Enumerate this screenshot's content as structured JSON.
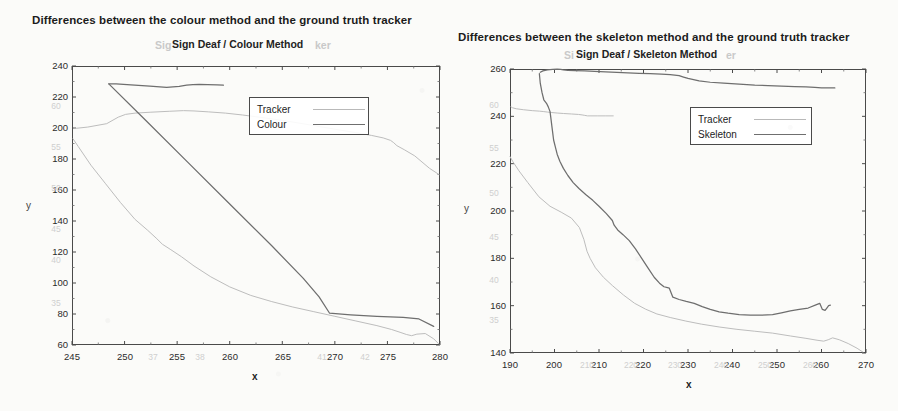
{
  "page": {
    "background": "#fbfbf9",
    "tracker_color": "#bdbdbd",
    "method_color": "#6e6e6e",
    "axis_color": "#4a4a4a"
  },
  "figures": [
    {
      "id": "colour",
      "caption": "Differences between the colour method and the ground truth tracker",
      "chart_title": "Sign Deaf / Colour Method",
      "ghost_title_left": "Sig",
      "ghost_title_right": "ker",
      "xlabel": "x",
      "ylabel": "y",
      "legend": [
        {
          "label": "Tracker",
          "style": "tracker"
        },
        {
          "label": "Colour",
          "style": "method"
        }
      ],
      "chart_data": {
        "type": "line",
        "title": "Sign Deaf / Colour Method",
        "xlabel": "x",
        "ylabel": "y",
        "xlim": [
          245,
          280
        ],
        "ylim": [
          60,
          240
        ],
        "xticks": [
          245,
          250,
          255,
          260,
          265,
          270,
          275,
          280
        ],
        "yticks": [
          60,
          80,
          100,
          120,
          140,
          160,
          180,
          200,
          220,
          240
        ],
        "ghost_xticks": [
          "37",
          "38",
          "41",
          "42"
        ],
        "ghost_yticks": [
          "60",
          "55",
          "50",
          "45",
          "40",
          "35"
        ],
        "grid": false,
        "legend_position": "upper-right",
        "series": [
          {
            "name": "Tracker",
            "x": [
              245.2,
              245.4,
              246.5,
              248.3,
              249.4,
              250.1,
              251.0,
              252.5,
              254.3,
              255.6,
              256.6,
              258.0,
              259.6,
              261.2,
              262.8,
              264.5,
              266.4,
              268.3,
              270.2,
              272.0,
              273.5,
              274.6,
              275.3,
              275.6,
              275.9,
              276.6,
              277.6,
              279.0,
              279.9
            ],
            "y": [
              200.0,
              199.8,
              200.6,
              202.8,
              207.0,
              208.8,
              209.6,
              210.2,
              210.8,
              211.2,
              211.0,
              210.4,
              209.6,
              208.4,
              207.0,
              205.4,
              203.4,
              201.2,
              199.0,
              197.0,
              195.2,
              193.6,
              192.0,
              190.5,
              188.6,
              186.0,
              182.0,
              174.0,
              170.0
            ]
          },
          {
            "name": "Tracker-lower",
            "x": [
              245.1,
              245.6,
              246.8,
              248.2,
              249.6,
              251.0,
              252.2,
              253.0,
              253.6,
              254.4,
              255.4,
              256.6,
              258.2,
              260.0,
              262.0,
              264.0,
              266.0,
              268.0,
              270.0,
              272.0,
              274.0,
              275.4,
              276.2,
              276.8,
              277.3,
              277.8,
              278.6,
              279.4,
              279.9
            ],
            "y": [
              193.0,
              188.0,
              176.0,
              164.0,
              152.0,
              141.0,
              134.0,
              129.0,
              125.0,
              121.5,
              117.0,
              111.0,
              104.0,
              97.5,
              92.0,
              88.0,
              84.5,
              81.5,
              78.5,
              75.5,
              72.5,
              70.0,
              68.2,
              66.8,
              66.0,
              67.0,
              67.4,
              64.0,
              60.6
            ]
          },
          {
            "name": "Colour",
            "x": [
              248.5,
              249.2,
              250.6,
              252.4,
              254.0,
              255.2,
              255.9,
              256.5,
              257.1,
              257.9,
              258.8,
              259.4
            ],
            "y": [
              228.5,
              228.4,
              227.8,
              227.0,
              226.2,
              226.8,
              227.6,
              228.0,
              228.1,
              228.0,
              227.8,
              227.6
            ]
          },
          {
            "name": "Colour-descent",
            "x": [
              248.5,
              252.0,
              256.0,
              260.0,
              264.0,
              267.0,
              268.5,
              269.5,
              271.5,
              274.0,
              276.5,
              278.0,
              279.4
            ],
            "y": [
              228.5,
              205.0,
              178.0,
              151.0,
              124.0,
              103.0,
              91.0,
              80.5,
              79.5,
              78.5,
              77.8,
              76.8,
              72.0
            ]
          }
        ]
      }
    },
    {
      "id": "skeleton",
      "caption": "Differences between the skeleton method and the ground truth tracker",
      "chart_title": "Sign Deaf / Skeleton Method",
      "ghost_title_left": "Si",
      "ghost_title_right": "er",
      "xlabel": "x",
      "ylabel": "y",
      "legend": [
        {
          "label": "Tracker",
          "style": "tracker"
        },
        {
          "label": "Skeleton",
          "style": "method"
        }
      ],
      "chart_data": {
        "type": "line",
        "title": "Sign Deaf / Skeleton Method",
        "xlabel": "x",
        "ylabel": "y",
        "xlim": [
          190,
          270
        ],
        "ylim": [
          140,
          260
        ],
        "xticks": [
          190,
          200,
          210,
          220,
          230,
          240,
          250,
          260,
          270
        ],
        "yticks": [
          140,
          160,
          180,
          200,
          220,
          240,
          260
        ],
        "ghost_xticks": [
          "210",
          "220",
          "230",
          "240",
          "250",
          "260"
        ],
        "ghost_yticks": [
          "60",
          "55",
          "50",
          "45",
          "40",
          "35"
        ],
        "grid": false,
        "legend_position": "upper-right",
        "series": [
          {
            "name": "Tracker",
            "x": [
              190.2,
              190.6,
              191.4,
              193.0,
              195.0,
              196.6,
              197.6,
              198.4,
              199.4,
              200.6,
              202.0,
              203.8,
              205.4,
              206.2,
              206.8,
              207.4,
              208.2,
              209.6,
              211.4,
              213.2
            ],
            "y": [
              244.0,
              243.6,
              243.2,
              242.8,
              242.4,
              242.2,
              242.0,
              241.8,
              241.6,
              241.4,
              241.2,
              241.0,
              240.8,
              240.6,
              240.4,
              240.2,
              240.2,
              240.2,
              240.2,
              240.2
            ]
          },
          {
            "name": "Tracker-descent",
            "x": [
              190.0,
              190.6,
              192.0,
              194.0,
              196.5,
              199.0,
              201.5,
              203.8,
              205.6,
              206.6,
              207.3,
              208.0,
              209.2,
              211.0,
              213.0,
              215.5,
              218.0,
              220.5,
              223.0,
              226.0,
              229.5,
              233.0,
              237.0,
              241.0,
              245.0,
              249.0,
              253.0,
              256.5,
              259.0,
              260.5,
              261.5,
              262.5,
              264.0,
              266.0,
              268.0,
              269.3
            ],
            "y": [
              223.0,
              221.0,
              217.0,
              212.0,
              206.0,
              202.0,
              199.5,
              197.0,
              193.0,
              188.0,
              183.0,
              180.0,
              176.0,
              172.0,
              168.5,
              164.5,
              161.0,
              158.5,
              156.5,
              155.0,
              153.5,
              152.2,
              151.0,
              150.0,
              149.2,
              148.4,
              147.2,
              146.2,
              145.4,
              145.0,
              145.6,
              146.4,
              145.6,
              144.0,
              142.0,
              140.4
            ]
          },
          {
            "name": "Skeleton",
            "x": [
              196.8,
              197.4,
              198.4,
              199.6,
              200.6,
              201.4,
              202.0,
              203.0,
              204.6,
              206.8,
              209.0,
              211.5,
              214.0,
              216.5,
              219.0,
              221.5,
              224.0,
              226.0,
              228.0,
              229.0,
              230.0,
              232.5,
              235.0,
              238.0,
              241.5,
              245.0,
              248.0,
              251.0,
              254.0,
              256.5,
              258.5,
              260.0,
              260.8,
              261.4,
              261.8,
              262.4,
              263.0
            ],
            "y": [
              258.6,
              259.2,
              259.6,
              259.8,
              259.9,
              259.8,
              259.6,
              259.4,
              259.3,
              259.2,
              259.0,
              258.8,
              258.6,
              258.4,
              258.2,
              258.0,
              257.8,
              257.6,
              257.2,
              256.6,
              256.0,
              255.0,
              254.4,
              254.0,
              253.6,
              253.2,
              253.0,
              252.8,
              252.6,
              252.4,
              252.2,
              252.0,
              252.0,
              252.0,
              252.0,
              252.0,
              252.0
            ]
          },
          {
            "name": "Skeleton-descent",
            "x": [
              196.6,
              196.8,
              197.2,
              197.6,
              198.2,
              198.6,
              199.0,
              199.2,
              199.4,
              199.6,
              199.8,
              200.2,
              200.6,
              201.2,
              202.0,
              203.0,
              204.2,
              205.5,
              207.0,
              208.6,
              210.0,
              211.6,
              213.0,
              213.4,
              214.2,
              215.4,
              216.8,
              218.2,
              219.6,
              221.0,
              222.4,
              223.6,
              224.6,
              225.4,
              225.8,
              226.6,
              228.0,
              229.6,
              231.4,
              233.2,
              235.0,
              237.0,
              239.0,
              241.5,
              244.0,
              246.5,
              249.0,
              251.0,
              253.0,
              255.0,
              257.0,
              258.6,
              259.6,
              260.2,
              260.8,
              261.2,
              261.6,
              262.0
            ],
            "y": [
              258.0,
              254.0,
              250.0,
              247.0,
              245.5,
              244.0,
              242.0,
              239.0,
              236.0,
              233.0,
              230.0,
              227.0,
              224.0,
              221.0,
              218.0,
              215.0,
              212.0,
              209.5,
              207.0,
              204.5,
              202.0,
              199.0,
              196.0,
              194.0,
              192.0,
              190.0,
              187.5,
              184.0,
              180.0,
              176.0,
              172.0,
              169.5,
              168.0,
              167.6,
              167.4,
              163.6,
              162.6,
              161.8,
              161.0,
              159.6,
              158.4,
              157.4,
              156.8,
              156.2,
              156.0,
              156.0,
              156.2,
              157.0,
              157.8,
              158.4,
              159.0,
              160.2,
              161.0,
              158.4,
              158.0,
              159.0,
              160.0,
              160.2
            ]
          }
        ]
      }
    }
  ]
}
